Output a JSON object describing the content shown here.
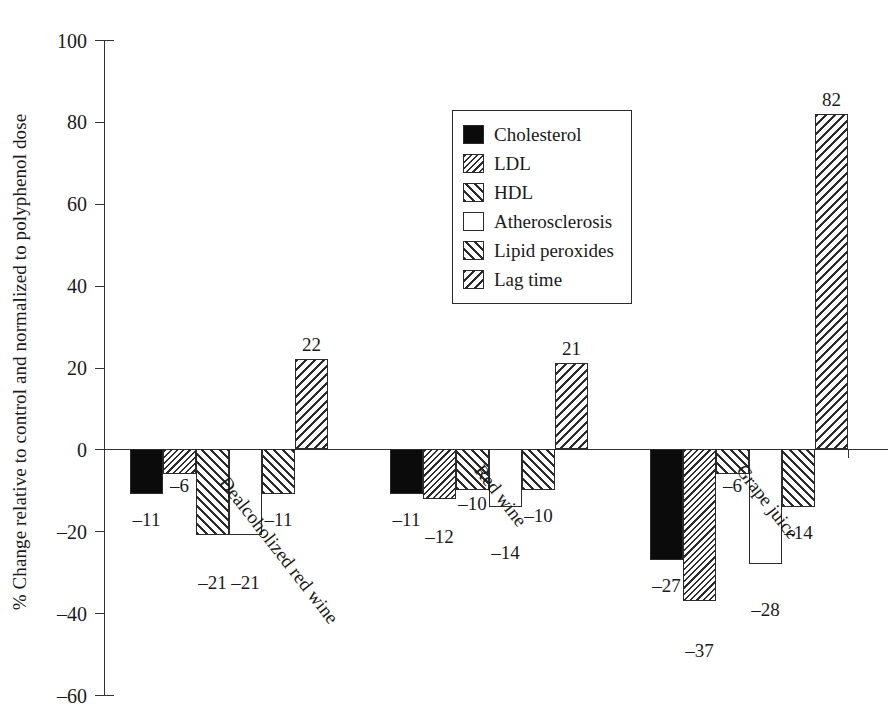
{
  "chart_data": {
    "type": "bar",
    "title": "",
    "subtitle": "",
    "xlabel": "",
    "ylabel": "% Change relative to control and normalized to polyphenol dose",
    "ylim": [
      -60,
      100
    ],
    "yticks": [
      100,
      80,
      60,
      40,
      20,
      0,
      -20,
      -40,
      -60
    ],
    "ytick_labels": [
      "100",
      "80",
      "60",
      "40",
      "20",
      "0",
      "–20",
      "–40",
      "–60"
    ],
    "grid": false,
    "legend_position": "upper center",
    "categories": [
      "Dealcoholized red wine",
      "Red wine",
      "Grape juice"
    ],
    "series": [
      {
        "name": "Cholesterol",
        "pattern": "solid",
        "values": [
          -11,
          -11,
          -27
        ],
        "labels": [
          "–11",
          "–11",
          "–27"
        ]
      },
      {
        "name": "LDL",
        "pattern": "bslash-fine",
        "values": [
          -6,
          -12,
          -37
        ],
        "labels": [
          "–6",
          "–12",
          "–37"
        ]
      },
      {
        "name": "HDL",
        "pattern": "fslash",
        "values": [
          -21,
          -10,
          -6
        ],
        "labels": [
          "–21",
          "–10",
          "–6"
        ]
      },
      {
        "name": "Atherosclerosis",
        "pattern": "none",
        "values": [
          -21,
          -14,
          -28
        ],
        "labels": [
          "–21",
          "–14",
          "–28"
        ]
      },
      {
        "name": "Lipid peroxides",
        "pattern": "fslash",
        "values": [
          -11,
          -10,
          -14
        ],
        "labels": [
          "–11",
          "–10",
          "–14"
        ]
      },
      {
        "name": "Lag time",
        "pattern": "bslash",
        "values": [
          22,
          21,
          82
        ],
        "labels": [
          "22",
          "21",
          "82"
        ]
      }
    ]
  },
  "legend": {
    "items": [
      {
        "label": "Cholesterol",
        "pattern": "solid"
      },
      {
        "label": "LDL",
        "pattern": "bslash-fine"
      },
      {
        "label": "HDL",
        "pattern": "fslash"
      },
      {
        "label": "Atherosclerosis",
        "pattern": "none"
      },
      {
        "label": "Lipid peroxides",
        "pattern": "fslash"
      },
      {
        "label": "Lag time",
        "pattern": "bslash"
      }
    ]
  },
  "colors": {
    "ink": "#1a1a1a",
    "axis": "#333333",
    "bar_fill_solid": "#0b0b0b",
    "bar_fill_empty": "#ffffff",
    "background": "#ffffff"
  },
  "layout": {
    "group_x_starts": [
      130,
      390,
      650
    ],
    "bar_width": 33,
    "bar_gap": 0,
    "plot_left": 104,
    "plot_top": 40,
    "plot_width": 784,
    "plot_height": 655
  }
}
